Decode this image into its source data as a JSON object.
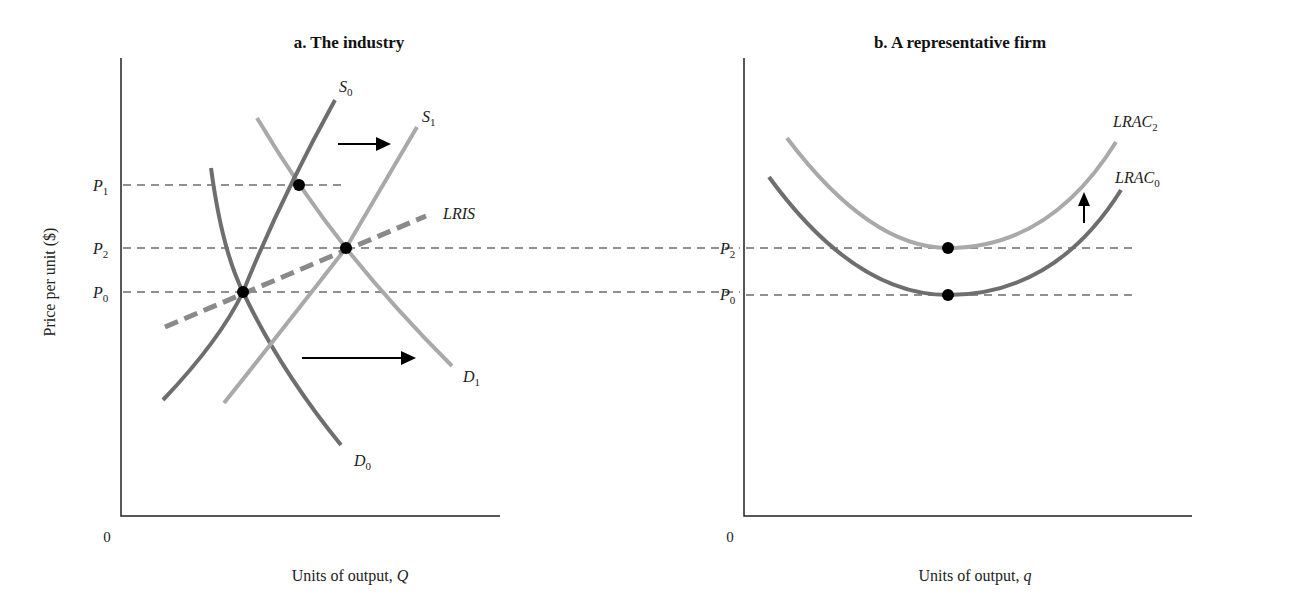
{
  "panel_a": {
    "title": "a. The industry",
    "y_axis_label": "Price per unit ($)",
    "x_axis_label_prefix": "Units of output, ",
    "x_axis_var": "Q",
    "origin": "0",
    "price_levels": [
      {
        "base": "P",
        "sub": "1"
      },
      {
        "base": "P",
        "sub": "2"
      },
      {
        "base": "P",
        "sub": "0"
      }
    ],
    "curves": {
      "S0": {
        "base": "S",
        "sub": "0"
      },
      "S1": {
        "base": "S",
        "sub": "1"
      },
      "D0": {
        "base": "D",
        "sub": "0"
      },
      "D1": {
        "base": "D",
        "sub": "1"
      },
      "LRIS": {
        "base": "LRIS",
        "sub": ""
      }
    }
  },
  "panel_b": {
    "title": "b. A representative firm",
    "x_axis_label_prefix": "Units of output, ",
    "x_axis_var": "q",
    "origin": "0",
    "price_levels": [
      {
        "base": "P",
        "sub": "2"
      },
      {
        "base": "P",
        "sub": "0"
      }
    ],
    "curves": {
      "LRAC2": {
        "base": "LRAC",
        "sub": "2"
      },
      "LRAC0": {
        "base": "LRAC",
        "sub": "0"
      }
    }
  },
  "colors": {
    "dark_curve": "#6e6e6e",
    "light_curve": "#a9a9a9",
    "lris": "#8a8a8a",
    "axis": "#222222"
  }
}
